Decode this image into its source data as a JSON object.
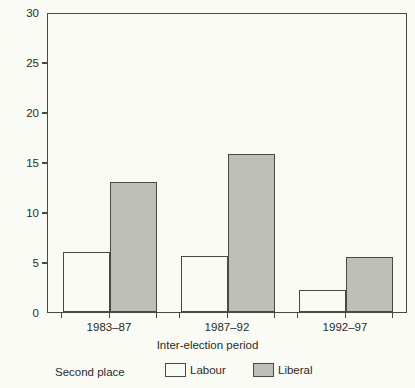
{
  "chart_data": {
    "type": "bar",
    "title": "",
    "xlabel": "Inter-election period",
    "ylabel": "Labour–Liberal",
    "categories": [
      "1983–87",
      "1987–92",
      "1992–97"
    ],
    "series": [
      {
        "name": "Labour",
        "values": [
          6.0,
          5.6,
          2.2
        ],
        "color": "#fbfbf5"
      },
      {
        "name": "Liberal",
        "values": [
          13.1,
          15.9,
          5.5
        ],
        "color": "#bfbfba"
      }
    ],
    "ylim": [
      0,
      30
    ],
    "yticks": [
      0,
      5,
      10,
      15,
      20,
      25,
      30
    ],
    "ytick_labels": [
      "0",
      "5",
      "10",
      "15",
      "20",
      "25",
      "30"
    ],
    "grid": false,
    "legend_position": "below-axes",
    "legend_title": "Second place",
    "border_color": "#4a4a42",
    "background_color": "#fbfbf5"
  },
  "legend": {
    "title": "Second place",
    "entries": [
      {
        "label": "Labour"
      },
      {
        "label": "Liberal"
      }
    ]
  }
}
